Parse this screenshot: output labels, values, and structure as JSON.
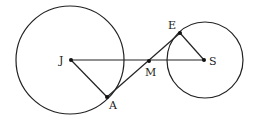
{
  "diagram": {
    "type": "geometry",
    "circles": [
      {
        "name": "circle-J",
        "center": "J",
        "cx": 70,
        "cy": 60,
        "r": 54
      },
      {
        "name": "circle-S",
        "center": "S",
        "cx": 205,
        "cy": 60,
        "r": 38
      }
    ],
    "points": {
      "J": {
        "label": "J",
        "x": 71,
        "y": 60
      },
      "A": {
        "label": "A",
        "x": 107,
        "y": 97
      },
      "M": {
        "label": "M",
        "x": 149,
        "y": 61
      },
      "E": {
        "label": "E",
        "x": 180,
        "y": 33
      },
      "S": {
        "label": "S",
        "x": 204,
        "y": 60
      }
    },
    "segments": [
      [
        "J",
        "S"
      ],
      [
        "J",
        "A"
      ],
      [
        "A",
        "E"
      ],
      [
        "E",
        "S"
      ]
    ]
  }
}
